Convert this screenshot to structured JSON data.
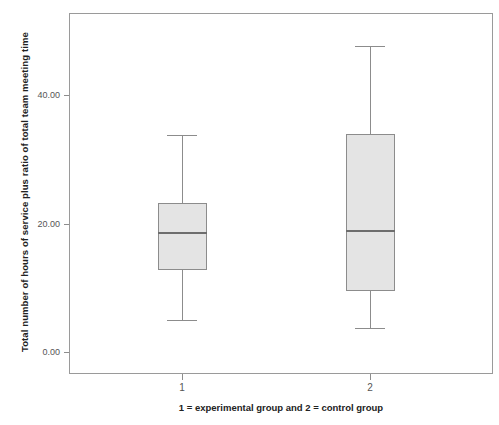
{
  "chart_data": {
    "type": "box",
    "title": "",
    "subtitle": "",
    "xlabel": "1 = experimental group and 2 = control group",
    "ylabel": "Total number of hours of service plus ratio of total team meeting time",
    "ylim": [
      -2.0,
      54.0
    ],
    "ytick_labels": [
      "0.00",
      "20.00",
      "40.00"
    ],
    "ytick_values": [
      0,
      20,
      40
    ],
    "xtick_labels": [
      "1",
      "2"
    ],
    "grid": false,
    "legend": null,
    "categories": [
      "1",
      "2"
    ],
    "box_fill_color": "#e4e4e4",
    "box_border_color": "#8c8c8c",
    "frame_color": "#9a9a9a",
    "series": [
      {
        "name": "1",
        "label": "1",
        "whisker_low": 5.0,
        "q1": 12.8,
        "median": 18.5,
        "q3": 23.2,
        "whisker_high": 33.8
      },
      {
        "name": "2",
        "label": "2",
        "whisker_low": 3.7,
        "q1": 9.5,
        "median": 18.8,
        "q3": 33.9,
        "whisker_high": 47.6
      }
    ]
  }
}
